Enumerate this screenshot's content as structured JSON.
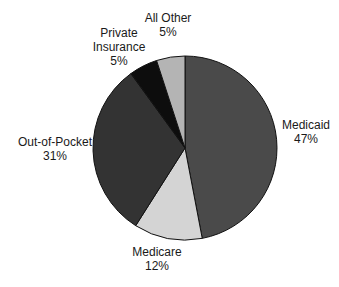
{
  "chart_data": {
    "type": "pie",
    "title": "",
    "start_angle_deg": 0,
    "direction": "clockwise",
    "slices": [
      {
        "label": "Medicaid",
        "value": 47,
        "display": "47%",
        "color": "#4a4a4a"
      },
      {
        "label": "Medicare",
        "value": 12,
        "display": "12%",
        "color": "#d4d4d4"
      },
      {
        "label": "Out-of-Pocket",
        "value": 31,
        "display": "31%",
        "color": "#333333"
      },
      {
        "label": "Private Insurance",
        "value": 5,
        "display": "5%",
        "color": "#0d0d0d"
      },
      {
        "label": "All Other",
        "value": 5,
        "display": "5%",
        "color": "#b4b4b4"
      }
    ],
    "labels": [
      {
        "lines": [
          "Medicaid",
          "47%"
        ]
      },
      {
        "lines": [
          "Medicare",
          "12%"
        ]
      },
      {
        "lines": [
          "Out-of-Pocket",
          "31%"
        ]
      },
      {
        "lines": [
          "Private",
          "Insurance",
          "5%"
        ]
      },
      {
        "lines": [
          "All Other",
          "5%"
        ]
      }
    ]
  }
}
